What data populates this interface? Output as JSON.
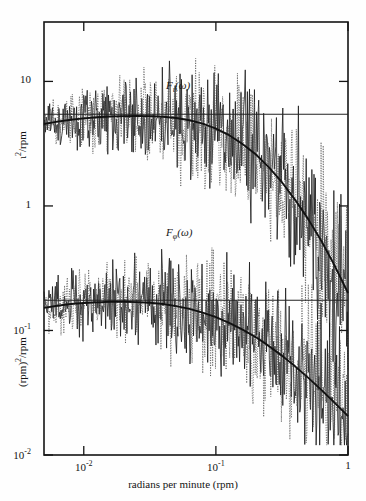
{
  "chart_data": {
    "type": "line",
    "title": "",
    "subtitle": "",
    "xlabel": "radians per minute (rpm)",
    "ylabel_upper": "ι²/rpm",
    "ylabel_lower": "(rpm)²/rpm",
    "xscale": "log",
    "yscale": "log",
    "xlim": [
      0.005,
      1.0
    ],
    "ylim": [
      0.01,
      30.0
    ],
    "grid": false,
    "legend_position": "none",
    "xticks": [
      0.01,
      0.1,
      1
    ],
    "xticklabels": [
      "10⁻²",
      "10⁻¹",
      "1"
    ],
    "yticks": [
      0.01,
      0.1,
      1,
      10
    ],
    "yticklabels": [
      "10⁻²",
      "10⁻¹",
      "1",
      "10"
    ],
    "annotations": [
      {
        "text": "F",
        "sub": "ι",
        "suffix": "(ω)",
        "x": 0.045,
        "y": 9.0,
        "name": "upper-spectrum-label"
      },
      {
        "text": "F",
        "sub": "φ",
        "suffix": "(ω)",
        "x": 0.045,
        "y": 0.6,
        "name": "lower-spectrum-label"
      }
    ],
    "series": [
      {
        "name": "F_iota smooth model",
        "style": "solid-thick",
        "color": "#111111",
        "description": "Smooth theoretical spectrum for F_ι(ω): flat plateau then roll-off",
        "x": [
          0.005,
          0.0063,
          0.008,
          0.01,
          0.0126,
          0.0158,
          0.02,
          0.0251,
          0.0316,
          0.0398,
          0.0501,
          0.0631,
          0.0794,
          0.1,
          0.126,
          0.158,
          0.2,
          0.251,
          0.316,
          0.398,
          0.501,
          0.631,
          0.794,
          1.0
        ],
        "y": [
          4.55,
          4.75,
          4.92,
          5.05,
          5.15,
          5.22,
          5.26,
          5.28,
          5.26,
          5.2,
          5.08,
          4.88,
          4.58,
          4.18,
          3.7,
          3.16,
          2.6,
          2.05,
          1.55,
          1.12,
          0.78,
          0.52,
          0.33,
          0.2
        ]
      },
      {
        "name": "F_iota asymptote",
        "style": "solid-thin",
        "color": "#222222",
        "description": "Horizontal white-noise asymptote level for F_ι",
        "x": [
          0.005,
          1.0
        ],
        "y": [
          5.45,
          5.45
        ]
      },
      {
        "name": "F_iota spectrum estimate A",
        "style": "solid-noisy",
        "color": "#1a1a1a",
        "description": "Raw periodogram estimate, solid trace"
      },
      {
        "name": "F_iota spectrum estimate B",
        "style": "dotted-noisy",
        "color": "#555555",
        "description": "Raw periodogram estimate, dotted trace"
      },
      {
        "name": "F_phi smooth model",
        "style": "solid-thick",
        "color": "#111111",
        "description": "Smooth theoretical spectrum for F_φ(ω)",
        "x": [
          0.005,
          0.0063,
          0.008,
          0.01,
          0.0126,
          0.0158,
          0.02,
          0.0251,
          0.0316,
          0.0398,
          0.0501,
          0.0631,
          0.0794,
          0.1,
          0.126,
          0.158,
          0.2,
          0.251,
          0.316,
          0.398,
          0.501,
          0.631,
          0.794,
          1.0
        ],
        "y": [
          0.152,
          0.158,
          0.163,
          0.166,
          0.168,
          0.17,
          0.17,
          0.169,
          0.167,
          0.163,
          0.157,
          0.149,
          0.139,
          0.128,
          0.115,
          0.102,
          0.0885,
          0.0752,
          0.0628,
          0.0515,
          0.0416,
          0.0332,
          0.0262,
          0.0205
        ]
      },
      {
        "name": "F_phi asymptote",
        "style": "solid-thin",
        "color": "#222222",
        "description": "Horizontal white-noise asymptote level for F_φ",
        "x": [
          0.005,
          1.0
        ],
        "y": [
          0.175,
          0.175
        ]
      },
      {
        "name": "F_phi spectrum estimate A",
        "style": "solid-noisy",
        "color": "#1a1a1a",
        "description": "Raw periodogram estimate, solid trace"
      },
      {
        "name": "F_phi spectrum estimate B",
        "style": "dotted-noisy",
        "color": "#555555",
        "description": "Raw periodogram estimate, dotted trace"
      }
    ]
  },
  "axes": {
    "frame_color": "#141414",
    "background": "#fefefe"
  }
}
